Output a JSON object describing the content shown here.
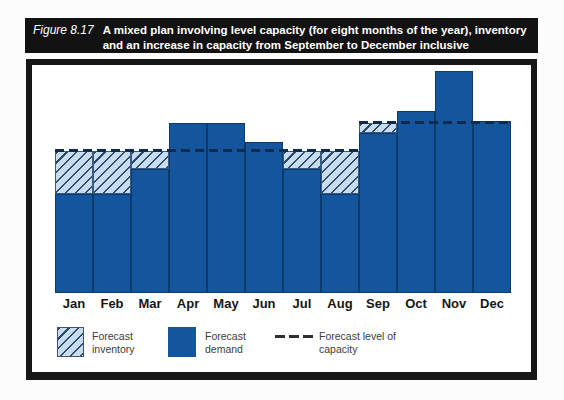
{
  "header": {
    "figure_label": "Figure 8.17",
    "title_lines": [
      "A mixed plan involving level capacity (for eight months of the year), inventory",
      "and an increase in capacity from September to December inclusive"
    ]
  },
  "legend": {
    "inventory": "Forecast inventory",
    "demand": "Forecast demand",
    "capacity": "Forecast level of capacity"
  },
  "colors": {
    "demand_bar": "#14569d",
    "inventory_fill": "#c9dcee",
    "inventory_hatch_line": "#27496f",
    "capacity_line": "#0e2a4d",
    "title_bar_bg": "#121212",
    "frame_border": "#171717"
  },
  "chart_data": {
    "type": "bar",
    "title": "A mixed plan involving level capacity (for eight months of the year), inventory and an increase in capacity from September to December inclusive",
    "categories": [
      "Jan",
      "Feb",
      "Mar",
      "Apr",
      "May",
      "Jun",
      "Jul",
      "Aug",
      "Sep",
      "Oct",
      "Nov",
      "Dec"
    ],
    "series": [
      {
        "name": "Forecast demand",
        "values": [
          70,
          70,
          87,
          120,
          120,
          106,
          87,
          70,
          113,
          128,
          156,
          121
        ]
      },
      {
        "name": "Forecast inventory",
        "values": [
          30,
          30,
          13,
          0,
          0,
          0,
          13,
          30,
          7,
          0,
          0,
          0
        ]
      },
      {
        "name": "Forecast level of capacity",
        "values": [
          100,
          100,
          100,
          100,
          100,
          100,
          100,
          100,
          120,
          120,
          120,
          120
        ]
      }
    ],
    "xlabel": "",
    "ylabel": "",
    "grid": false,
    "legend_position": "bottom",
    "axis_note": "No numeric axis shown in figure; values estimated as percent of the Jan-Aug level-capacity line (capacity Jan-Aug = 100, Sep-Dec = 120)"
  }
}
